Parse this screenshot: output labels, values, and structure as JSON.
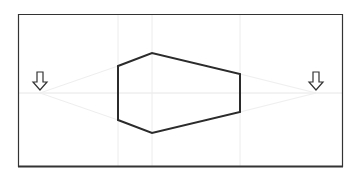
{
  "canvas": {
    "width": 360,
    "height": 175,
    "background": "#ffffff"
  },
  "frame": {
    "x1": 18,
    "y1": 14,
    "x2": 343,
    "y2": 167,
    "stroke": "#333333"
  },
  "horizon_line": {
    "y": 93,
    "color": "#e6e6e6"
  },
  "guide_lines": {
    "vertical_x": [
      118,
      152,
      240
    ],
    "color": "#ececec"
  },
  "vanishing_points": [
    {
      "name": "left-vanishing-point",
      "x": 40,
      "y": 93,
      "icon": "down-arrow-icon"
    },
    {
      "name": "right-vanishing-point",
      "x": 316,
      "y": 93,
      "icon": "down-arrow-icon"
    }
  ],
  "shape": {
    "type": "two-point-perspective-box",
    "points": "118,66 152,53 240,74 240,112 152,133 118,120",
    "stroke": "#2b2b2b",
    "stroke_width": 2
  },
  "perspective_lines_color": "#eeeeee"
}
